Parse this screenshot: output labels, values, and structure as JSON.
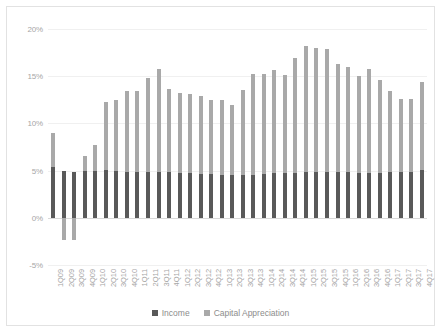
{
  "chart_data": {
    "type": "bar",
    "stacked": true,
    "title": "",
    "xlabel": "",
    "ylabel": "",
    "ylim": [
      -5,
      20
    ],
    "yticks": [
      "-5%",
      "0%",
      "5%",
      "10%",
      "15%",
      "20%"
    ],
    "ytick_values": [
      -5,
      0,
      5,
      10,
      15,
      20
    ],
    "grid": true,
    "legend_position": "bottom",
    "categories": [
      "1Q09",
      "2Q09",
      "3Q09",
      "4Q09",
      "1Q10",
      "2Q10",
      "3Q10",
      "4Q10",
      "1Q11",
      "2Q11",
      "3Q11",
      "4Q11",
      "1Q12",
      "2Q12",
      "3Q12",
      "4Q12",
      "1Q13",
      "2Q13",
      "3Q13",
      "4Q13",
      "1Q14",
      "2Q14",
      "3Q14",
      "4Q14",
      "1Q15",
      "2Q15",
      "3Q15",
      "4Q15",
      "1Q16",
      "2Q16",
      "3Q16",
      "4Q16",
      "1Q17",
      "2Q17",
      "3Q17",
      "4Q17"
    ],
    "series": [
      {
        "name": "Income",
        "color": "#595959",
        "values": [
          5.4,
          5.0,
          4.9,
          5.0,
          5.0,
          5.1,
          5.0,
          4.9,
          4.9,
          4.8,
          4.8,
          4.8,
          4.7,
          4.7,
          4.6,
          4.6,
          4.5,
          4.5,
          4.5,
          4.5,
          4.6,
          4.7,
          4.7,
          4.7,
          4.8,
          4.8,
          4.8,
          4.8,
          4.8,
          4.7,
          4.7,
          4.7,
          4.8,
          4.8,
          4.9,
          5.1
        ]
      },
      {
        "name": "Capital Appreciation",
        "color": "#a9a9a9",
        "values": [
          3.6,
          -2.4,
          -2.4,
          1.5,
          2.7,
          7.2,
          7.5,
          8.5,
          8.5,
          10.0,
          11.0,
          8.8,
          8.5,
          8.4,
          8.3,
          7.9,
          8.0,
          7.4,
          9.0,
          10.7,
          10.6,
          11.0,
          10.4,
          12.2,
          13.4,
          13.2,
          13.1,
          11.5,
          11.2,
          10.3,
          11.1,
          9.9,
          8.6,
          7.8,
          7.7,
          9.3
        ]
      }
    ],
    "legend": [
      {
        "label": "Income",
        "color": "#595959"
      },
      {
        "label": "Capital Appreciation",
        "color": "#a9a9a9"
      }
    ]
  }
}
